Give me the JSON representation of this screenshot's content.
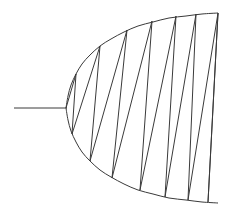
{
  "figure": {
    "background_color": "#ffffff",
    "stroke_color": "#3a3a3a",
    "stroke_width": 1,
    "canvas": {
      "width": 234,
      "height": 219
    }
  },
  "chart_data": {
    "type": "line",
    "xlabel": "",
    "ylabel": "",
    "xlim": [
      0,
      234
    ],
    "ylim": [
      0,
      219
    ],
    "grid": false,
    "legend": "none",
    "axis_y_center": 108,
    "vertex": {
      "x": 66,
      "y": 108
    },
    "series": [
      {
        "name": "tail-line",
        "kind": "polyline",
        "points": [
          [
            14,
            108
          ],
          [
            67,
            108
          ]
        ]
      },
      {
        "name": "upper-branch",
        "kind": "parabola-arc",
        "points": [
          [
            66,
            108
          ],
          [
            68,
            96
          ],
          [
            71,
            85
          ],
          [
            76,
            74
          ],
          [
            82,
            64
          ],
          [
            90,
            55
          ],
          [
            100,
            46
          ],
          [
            111,
            39
          ],
          [
            124,
            32
          ],
          [
            138,
            26
          ],
          [
            153,
            22
          ],
          [
            169,
            18
          ],
          [
            186,
            16
          ],
          [
            202,
            14
          ],
          [
            218,
            13
          ]
        ]
      },
      {
        "name": "lower-branch",
        "kind": "parabola-arc",
        "points": [
          [
            66,
            108
          ],
          [
            68,
            120
          ],
          [
            71,
            131
          ],
          [
            76,
            142
          ],
          [
            82,
            152
          ],
          [
            90,
            161
          ],
          [
            100,
            170
          ],
          [
            111,
            177
          ],
          [
            124,
            184
          ],
          [
            138,
            190
          ],
          [
            153,
            194
          ],
          [
            169,
            198
          ],
          [
            186,
            200
          ],
          [
            202,
            202
          ],
          [
            218,
            203
          ]
        ]
      },
      {
        "name": "zigzag-polyline",
        "kind": "polyline",
        "points": [
          [
            66,
            108
          ],
          [
            76,
            74
          ],
          [
            72,
            134
          ],
          [
            100,
            46
          ],
          [
            90,
            161
          ],
          [
            127,
            30
          ],
          [
            112,
            178
          ],
          [
            152,
            21
          ],
          [
            140,
            190
          ],
          [
            176,
            16
          ],
          [
            165,
            197
          ],
          [
            196,
            14
          ],
          [
            188,
            200
          ],
          [
            218,
            13
          ],
          [
            208,
            202
          ],
          [
            218,
            13
          ]
        ]
      }
    ],
    "upper_vertices_x": [
      76,
      100,
      127,
      152,
      176,
      196,
      218
    ],
    "lower_vertices_x": [
      72,
      90,
      112,
      140,
      165,
      188,
      208
    ],
    "triangle_count": 13
  }
}
